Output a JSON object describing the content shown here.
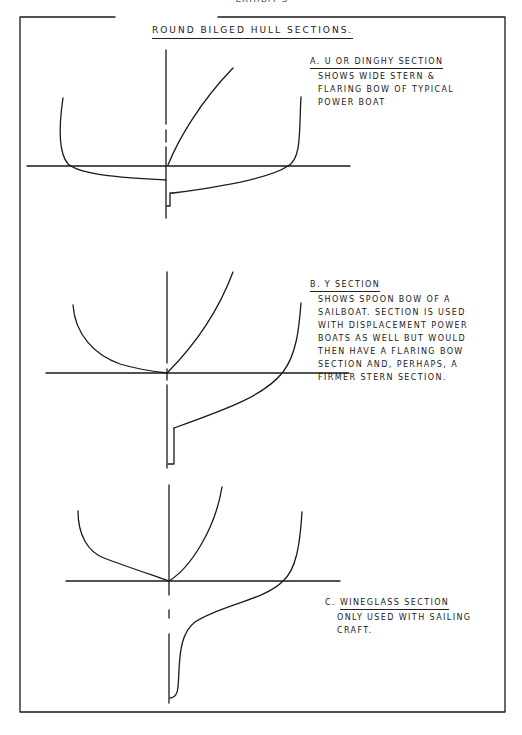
{
  "page_header": "EXHIBIT 3",
  "title": "ROUND BILGED HULL SECTIONS.",
  "colors": {
    "line": "#1a1a1a",
    "background": "#ffffff"
  },
  "sections": [
    {
      "id": "A",
      "letter": "A.",
      "heading": "U OR DINGHY SECTION",
      "description_lines": [
        "SHOWS WIDE STERN &",
        "FLARING BOW OF TYPICAL",
        "POWER BOAT"
      ]
    },
    {
      "id": "B",
      "letter": "B.",
      "heading": "Y SECTION",
      "description_lines": [
        "SHOWS SPOON BOW OF A",
        "SAILBOAT. SECTION IS USED",
        "WITH DISPLACEMENT POWER",
        "BOATS AS WELL BUT WOULD",
        "THEN HAVE A FLARING BOW",
        "SECTION AND, PERHAPS, A",
        "FIRMER STERN SECTION."
      ]
    },
    {
      "id": "C",
      "letter": "C.",
      "heading": "WINEGLASS SECTION",
      "description_lines": [
        "ONLY USED WITH SAILING",
        "CRAFT."
      ]
    }
  ]
}
